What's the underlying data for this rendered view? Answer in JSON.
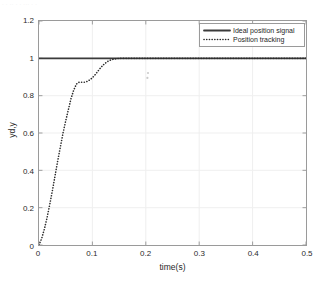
{
  "figure": {
    "top_artifact_text": "· · ·· · · ··· · ·"
  },
  "chart_data": {
    "type": "line",
    "title": "",
    "xlabel": "time(s)",
    "ylabel": "yd,y",
    "xlim": [
      0,
      0.5
    ],
    "ylim": [
      0,
      1.2
    ],
    "xticks": [
      0,
      0.1,
      0.2,
      0.3,
      0.4,
      0.5
    ],
    "xticklabels": [
      "0",
      "0.1",
      "0.2",
      "0.3",
      "0.4",
      "0.5"
    ],
    "yticks": [
      0,
      0.2,
      0.4,
      0.6,
      0.8,
      1,
      1.2
    ],
    "yticklabels": [
      "0",
      "0.2",
      "0.4",
      "0.6",
      "0.8",
      "1",
      "1.2"
    ],
    "grid": true,
    "grid_color": "#efefef",
    "box": true,
    "legend_position": "upper right",
    "series": [
      {
        "name": "Ideal position signal",
        "style": "solid",
        "color": "#3b3b3b",
        "width": 1.8,
        "x": [
          0,
          0.5
        ],
        "values": [
          1,
          1
        ]
      },
      {
        "name": "Position tracking",
        "style": "dotted",
        "color": "#2b2b2b",
        "width": 1.6,
        "x": [
          0,
          0.005,
          0.01,
          0.015,
          0.02,
          0.025,
          0.03,
          0.035,
          0.04,
          0.045,
          0.05,
          0.055,
          0.06,
          0.065,
          0.07,
          0.075,
          0.08,
          0.085,
          0.09,
          0.095,
          0.1,
          0.105,
          0.11,
          0.115,
          0.12,
          0.125,
          0.13,
          0.135,
          0.14,
          0.145,
          0.15,
          0.16,
          0.17,
          0.18,
          0.19,
          0.2,
          0.22,
          0.24,
          0.26,
          0.28,
          0.3,
          0.32,
          0.34,
          0.36,
          0.38,
          0.4,
          0.42,
          0.44,
          0.46,
          0.48,
          0.5
        ],
        "values": [
          0,
          0.035,
          0.085,
          0.145,
          0.215,
          0.29,
          0.37,
          0.45,
          0.525,
          0.6,
          0.665,
          0.725,
          0.785,
          0.83,
          0.862,
          0.872,
          0.872,
          0.872,
          0.876,
          0.884,
          0.896,
          0.912,
          0.93,
          0.948,
          0.964,
          0.976,
          0.986,
          0.992,
          0.996,
          0.998,
          1.0,
          1.0,
          1.0,
          1.0,
          1.0,
          1.0,
          1.0,
          1.0,
          1.0,
          1.0,
          1.0,
          1.0,
          1.0,
          1.0,
          1.0,
          1.0,
          1.0,
          1.0,
          1.0,
          1.0,
          1.0
        ]
      }
    ],
    "annotations": [
      {
        "name": "stray-marker",
        "x": 0.203,
        "y": 0.895
      }
    ]
  }
}
